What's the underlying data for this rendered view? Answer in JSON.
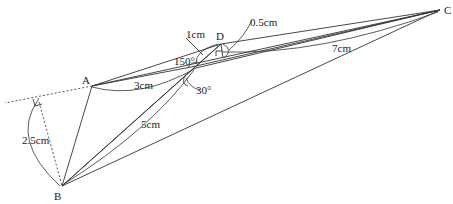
{
  "diagram": {
    "points": {
      "A": {
        "label": "A",
        "x": 92,
        "y": 86
      },
      "B": {
        "label": "B",
        "x": 62,
        "y": 186
      },
      "C": {
        "label": "C",
        "x": 440,
        "y": 10
      },
      "D": {
        "label": "D",
        "x": 221,
        "y": 44
      },
      "O": {
        "label": "",
        "x": 196,
        "y": 66
      }
    },
    "measurements": {
      "one_cm": "1cm",
      "half_cm": "0.5cm",
      "seven_cm": "7cm",
      "three_cm": "3cm",
      "five_cm": "5cm",
      "two_five_cm": "2.5cm"
    },
    "angles": {
      "angle_150": "150°",
      "angle_30": "30°"
    }
  }
}
